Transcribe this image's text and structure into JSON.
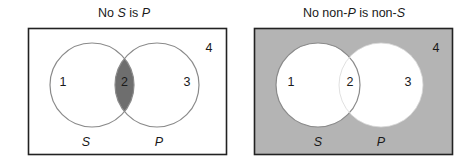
{
  "diagrams": [
    {
      "title_parts": [
        "No ",
        "S",
        " is ",
        "P"
      ],
      "title_italic": [
        false,
        true,
        false,
        true
      ],
      "background": "#ffffff",
      "shaded_region": "2",
      "shade_color": "#6e6e6e",
      "regions": {
        "r1": "1",
        "r2": "2",
        "r3": "3",
        "r4": "4"
      },
      "sets": {
        "left": "S",
        "right": "P"
      }
    },
    {
      "title_parts": [
        "No non-",
        "P",
        " is non-",
        "S"
      ],
      "title_italic": [
        false,
        true,
        false,
        true
      ],
      "background": "#b4b4b4",
      "shaded_region": "4",
      "shade_color": "#b4b4b4",
      "regions": {
        "r1": "1",
        "r2": "2",
        "r3": "3",
        "r4": "4"
      },
      "sets": {
        "left": "S",
        "right": "P"
      }
    }
  ],
  "colors": {
    "border": "#222222",
    "circle_stroke": "#8a8a8a",
    "text": "#1a1a1a"
  }
}
